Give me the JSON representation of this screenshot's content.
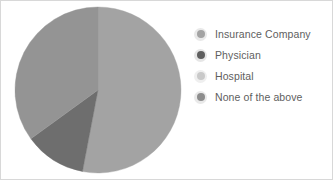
{
  "chart_data": {
    "type": "pie",
    "title": "",
    "xlabel": "",
    "ylabel": "",
    "grid": false,
    "legend_position": "right",
    "categories": [
      "Insurance Company",
      "Physician",
      "Hospital",
      "None of the above"
    ],
    "values": [
      53,
      12,
      35,
      0
    ],
    "slices": [
      {
        "label": "Insurance Company",
        "value": 53,
        "color": "#a3a3a3",
        "start_angle": 0,
        "end_angle": 190.8
      },
      {
        "label": "Physician",
        "value": 12,
        "color": "#6e6e6e",
        "start_angle": 190.8,
        "end_angle": 234.0
      },
      {
        "label": "Hospital",
        "value": 35,
        "color": "#949494",
        "start_angle": 234.0,
        "end_angle": 360.0
      },
      {
        "label": "None of the above",
        "value": 0,
        "color": "#8d8d8d",
        "start_angle": 360.0,
        "end_angle": 360.0
      }
    ],
    "center": {
      "cx": 86,
      "cy": 86
    },
    "radius": 83
  },
  "legend": {
    "items": [
      {
        "label": "Insurance Company",
        "color": "#a3a3a3",
        "ring": "#e9e9e9"
      },
      {
        "label": "Physician",
        "color": "#5f5f5f",
        "ring": "#e6e6e6"
      },
      {
        "label": "Hospital",
        "color": "#c9c9c9",
        "ring": "#efefef"
      },
      {
        "label": "None of the above",
        "color": "#8d8d8d",
        "ring": "#e9e9e9"
      }
    ]
  },
  "frame": {
    "background": "#ffffff",
    "border_color": "#d8d8d8"
  }
}
